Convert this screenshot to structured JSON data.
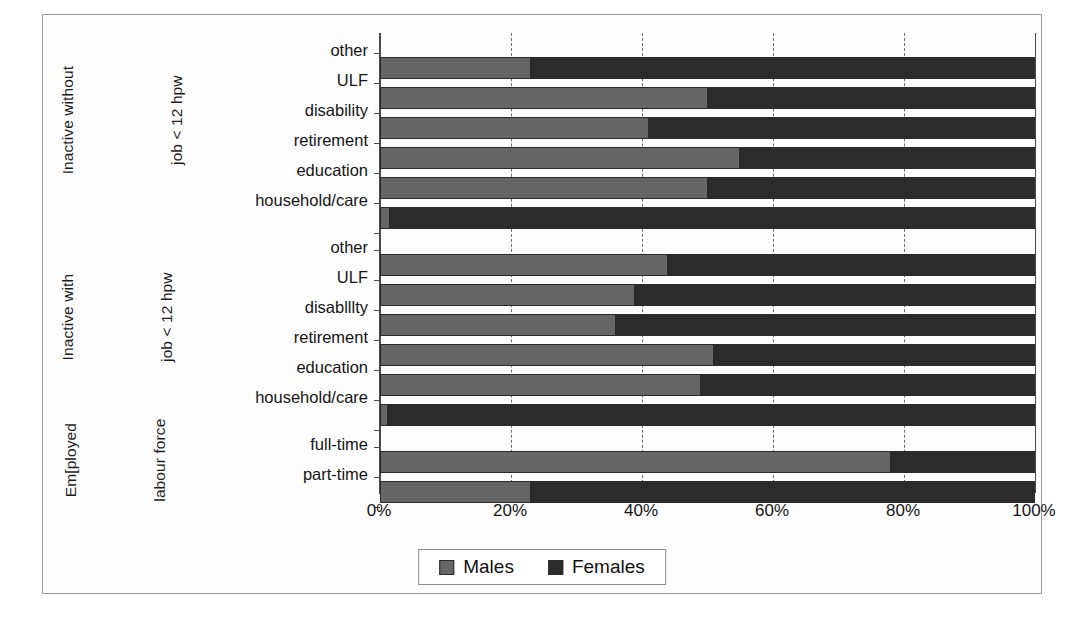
{
  "chart_data": {
    "type": "bar",
    "orientation": "horizontal",
    "stacked": true,
    "normalized": true,
    "title": "",
    "xlabel": "",
    "ylabel": "",
    "xlim": [
      0,
      100
    ],
    "xticks": [
      "0%",
      "20%",
      "40%",
      "60%",
      "80%",
      "100%"
    ],
    "xtick_values": [
      0,
      20,
      40,
      60,
      80,
      100
    ],
    "grid": "vertical dashed gridlines at 20%, 40%, 60%, 80%",
    "legend": {
      "position": "bottom-center",
      "entries": [
        {
          "name": "Males",
          "color": "#666666"
        },
        {
          "name": "Females",
          "color": "#2b2b2b"
        }
      ]
    },
    "series": [
      {
        "name": "Males",
        "color": "#666666"
      },
      {
        "name": "Females",
        "color": "#2b2b2b"
      }
    ],
    "groups": [
      {
        "label_lines": [
          "Inactive without",
          "job < 12 hpw"
        ],
        "categories": [
          "other",
          "ULF",
          "disability",
          "retirement",
          "education",
          "household/care"
        ],
        "males": [
          23,
          50,
          41,
          55,
          50,
          1.5
        ],
        "females": [
          77,
          50,
          59,
          45,
          50,
          98.5
        ]
      },
      {
        "label_lines": [
          "Inactive with",
          "job < 12 hpw"
        ],
        "categories": [
          "other",
          "ULF",
          "disablllty",
          "retirement",
          "education",
          "household/care"
        ],
        "males": [
          44,
          39,
          36,
          51,
          49,
          1.2
        ],
        "females": [
          56,
          61,
          64,
          49,
          51,
          98.8
        ]
      },
      {
        "label_lines": [
          "Em[ployed",
          "labour force"
        ],
        "categories": [
          "full-time",
          "part-time"
        ],
        "males": [
          78,
          23
        ],
        "females": [
          22,
          77
        ]
      }
    ]
  },
  "legend": {
    "males_label": "Males",
    "females_label": "Females"
  }
}
